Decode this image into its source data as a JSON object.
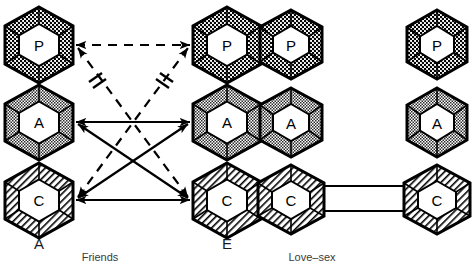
{
  "figure": {
    "panels": [
      {
        "id": "friends",
        "caption": "Friends",
        "left_person_label": "A",
        "right_person_label": "E",
        "columns": [
          {
            "id": "friends-left",
            "person": "A",
            "states": [
              {
                "id": "P",
                "label": "P",
                "name": "Parent",
                "fill": "dotted-dark"
              },
              {
                "id": "A",
                "label": "A",
                "name": "Adult",
                "fill": "checker-light"
              },
              {
                "id": "C",
                "label": "C",
                "name": "Child",
                "fill": "diagonal-hatch"
              }
            ]
          },
          {
            "id": "friends-right",
            "person": "E",
            "states": [
              {
                "id": "P",
                "label": "P",
                "name": "Parent",
                "fill": "dotted-dark"
              },
              {
                "id": "A",
                "label": "A",
                "name": "Adult",
                "fill": "checker-light"
              },
              {
                "id": "C",
                "label": "C",
                "name": "Child",
                "fill": "diagonal-hatch"
              }
            ]
          }
        ],
        "transactions": [
          {
            "id": "t-pp",
            "from": "left-P",
            "to": "right-P",
            "style": "dashed",
            "heads": "both",
            "blocked": false
          },
          {
            "id": "t-aa",
            "from": "left-A",
            "to": "right-A",
            "style": "solid",
            "heads": "both",
            "blocked": false
          },
          {
            "id": "t-cc",
            "from": "left-C",
            "to": "right-C",
            "style": "solid",
            "heads": "both",
            "blocked": false
          },
          {
            "id": "t-leftP-rightC",
            "from": "left-P",
            "to": "right-C",
            "style": "dashed",
            "heads": "both",
            "blocked": true,
            "block_symbol": "≠"
          },
          {
            "id": "t-leftC-rightP",
            "from": "left-C",
            "to": "right-P",
            "style": "dashed",
            "heads": "both",
            "blocked": true,
            "block_symbol": "≠"
          },
          {
            "id": "t-leftA-rightC",
            "from": "left-A",
            "to": "right-C",
            "style": "solid",
            "heads": "both",
            "blocked": false
          },
          {
            "id": "t-leftC-rightA",
            "from": "left-C",
            "to": "right-A",
            "style": "solid",
            "heads": "both",
            "blocked": false
          }
        ]
      },
      {
        "id": "love-sex",
        "caption": "Love–sex",
        "left_person_label": "",
        "right_person_label": "",
        "columns": [
          {
            "id": "love-left",
            "person": "",
            "states": [
              {
                "id": "P",
                "label": "P",
                "name": "Parent",
                "fill": "dotted-dark"
              },
              {
                "id": "A",
                "label": "A",
                "name": "Adult",
                "fill": "checker-light"
              },
              {
                "id": "C",
                "label": "C",
                "name": "Child",
                "fill": "diagonal-hatch"
              }
            ]
          },
          {
            "id": "love-right",
            "person": "",
            "states": [
              {
                "id": "P",
                "label": "P",
                "name": "Parent",
                "fill": "dotted-dark"
              },
              {
                "id": "A",
                "label": "A",
                "name": "Adult",
                "fill": "checker-light"
              },
              {
                "id": "C",
                "label": "C",
                "name": "Child",
                "fill": "diagonal-hatch"
              }
            ]
          }
        ],
        "transactions": [
          {
            "id": "t-cc-upper",
            "from": "right-C",
            "to": "left-C",
            "style": "solid",
            "heads": "left",
            "blocked": false
          },
          {
            "id": "t-cc-lower",
            "from": "left-C",
            "to": "right-C",
            "style": "solid",
            "heads": "right",
            "blocked": false
          }
        ]
      }
    ],
    "colors": {
      "ink": "#000000",
      "paper": "#ffffff",
      "caption": "#3a3a3a",
      "label": "#1a1a1a"
    }
  }
}
